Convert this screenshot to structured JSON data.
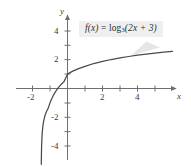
{
  "figure": {
    "name": "logarithmic-function-graph",
    "background_color": "#ffffff",
    "curve_color": "#4a4a4a",
    "axis_color": "#6f6f6f",
    "label_background": "#efefef",
    "text_color": "#3b3b3b"
  },
  "labels": {
    "x_axis_name": "x",
    "y_axis_name": "y",
    "function_prefix": "f",
    "function_arg": "(x)",
    "function_equals": " = ",
    "function_log": "log",
    "function_base": "3",
    "function_body": "(2x + 3)",
    "function_full": "f(x) = log₃(2x + 3)"
  },
  "chart_data": {
    "type": "line",
    "title": "",
    "subtitle": "",
    "xlabel": "x",
    "ylabel": "y",
    "annotations": [
      {
        "text": "f(x) = log₃(2x + 3)",
        "x": 2.6,
        "y": 3.6,
        "style": "boxed-callout"
      }
    ],
    "legend": [],
    "legend_position": "none",
    "grid": false,
    "xlim": [
      -2.9,
      6.1
    ],
    "ylim": [
      -5.4,
      4.9
    ],
    "xticks": [
      -2,
      -1,
      1,
      2,
      3,
      4,
      5
    ],
    "xtick_labels": [
      "-2",
      "",
      "",
      "2",
      "",
      "4",
      ""
    ],
    "yticks": [
      -4,
      -3,
      -2,
      -1,
      1,
      2,
      3,
      4
    ],
    "ytick_labels": [
      "-4",
      "",
      "-2",
      "",
      "",
      "2",
      "",
      "4"
    ],
    "vertical_asymptote": -1.5,
    "x_intercept": -1.0,
    "y_intercept": 1.0,
    "function_expression": "log(2*x + 3)/log(3)",
    "series": [
      {
        "name": "f(x) = log₃(2x + 3)",
        "color": "#4a4a4a",
        "x": [
          -1.497,
          -1.49,
          -1.48,
          -1.46,
          -1.44,
          -1.42,
          -1.4,
          -1.37,
          -1.34,
          -1.3,
          -1.25,
          -1.2,
          -1.15,
          -1.1,
          -1.0,
          -0.9,
          -0.8,
          -0.7,
          -0.6,
          -0.5,
          -0.4,
          -0.2,
          0.0,
          0.3,
          0.6,
          1.0,
          1.5,
          2.0,
          2.5,
          3.0,
          3.5,
          4.0,
          4.5,
          5.0,
          5.5,
          6.0
        ],
        "y": [
          -5.28,
          -4.65,
          -4.02,
          -3.39,
          -3.02,
          -2.76,
          -2.56,
          -2.33,
          -2.15,
          -1.95,
          -1.76,
          -1.61,
          -1.48,
          -1.37,
          -1.0,
          -0.71,
          -0.46,
          -0.25,
          -0.07,
          0.09,
          0.24,
          0.48,
          1.0,
          1.21,
          1.37,
          1.54,
          1.74,
          1.89,
          2.02,
          2.13,
          2.23,
          2.32,
          2.39,
          2.46,
          2.53,
          2.59
        ]
      }
    ]
  }
}
